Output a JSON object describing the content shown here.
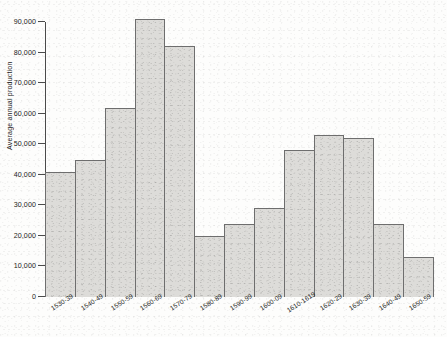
{
  "chart_data": {
    "type": "bar",
    "title": "",
    "xlabel": "",
    "ylabel": "Average annual production",
    "ylim": [
      0,
      90000
    ],
    "ytick_step": 10000,
    "grid": false,
    "legend": null,
    "categories": [
      "1530-39",
      "1540-49",
      "1550-59",
      "1560-69",
      "1570-79",
      "1580-89",
      "1590-99",
      "1600-09",
      "1610-1619",
      "1620-29",
      "1630-39",
      "1640-49",
      "1650-59"
    ],
    "values": [
      41000,
      45000,
      62000,
      91000,
      82000,
      20000,
      24000,
      29000,
      48000,
      53000,
      52000,
      24000,
      13000
    ],
    "ytick_labels": [
      "0",
      "10,000",
      "20,000",
      "30,000",
      "40,000",
      "50,000",
      "60,000",
      "70,000",
      "80,000",
      "90,000"
    ],
    "ytick_values": [
      0,
      10000,
      20000,
      30000,
      40000,
      50000,
      60000,
      70000,
      80000,
      90000
    ],
    "bar_fill_color": "#dddcd9",
    "bar_edge_color": "#6e6e6e",
    "axis_color": "#4a4a4a"
  }
}
